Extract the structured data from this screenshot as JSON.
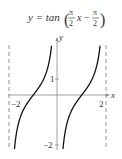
{
  "figure": {
    "equation": "y = tan(π/2 x − π/2)",
    "equation_parts": {
      "lhs": "y = tan",
      "frac1_num": "π",
      "frac1_den": "2",
      "var": "x",
      "minus": "−",
      "frac2_num": "π",
      "frac2_den": "2"
    },
    "x_axis_label": "x",
    "y_axis_label": "y",
    "tick_labels": {
      "x_neg": "−2",
      "x_pos": "2",
      "y_pos": "1",
      "y_neg": "−2"
    }
  },
  "colors": {
    "curve": "#111111",
    "axis": "#888888",
    "asymptote": "#777777"
  },
  "asymptotes": [
    -2,
    0,
    2
  ]
}
